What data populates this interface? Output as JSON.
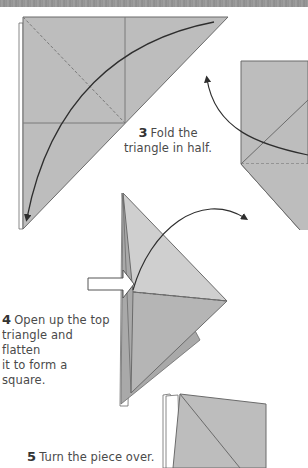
{
  "page": {
    "type": "origami-instructions",
    "colors": {
      "paper_fill": "#bdbdbd",
      "paper_light": "#cfcfcf",
      "paper_dark": "#a9a9a9",
      "line": "#6b6b6b",
      "arrow": "#2e2e2e",
      "caption": "#4a4a4a",
      "top_band": "#969696"
    }
  },
  "steps": [
    {
      "number": "3",
      "text": "Fold the triangle in half.",
      "line1": "Fold the",
      "line2": "triangle in half."
    },
    {
      "number": "4",
      "text": "Open up the top triangle and flatten it to form a square.",
      "line1": "Open up the top",
      "line2": "triangle and flatten",
      "line3": "it to form a square."
    },
    {
      "number": "5",
      "text": "Turn the piece over."
    }
  ],
  "icons": {
    "fold_arrow_step3": "curved-fold-arrow",
    "fold_arrow_step2_partial": "curved-fold-arrow",
    "open_arrow_step4": "curved-fold-arrow",
    "push_arrow_step4": "hollow-push-arrow"
  }
}
